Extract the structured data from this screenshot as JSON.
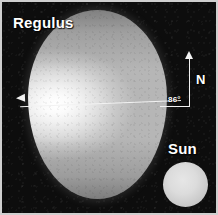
{
  "figure": {
    "title": "Regulus",
    "background_color": "#0d0d0d",
    "border_color": "#cfcfcf"
  },
  "star": {
    "name_label": "Regulus",
    "shape": "oblate-spheroid",
    "surface_color_bright": "#ffffff",
    "surface_color_dim": "#a8a8a8"
  },
  "comparison": {
    "name_label": "Sun",
    "disk_color": "#dcdcdc"
  },
  "annotations": {
    "north_label": "N",
    "inclination_angle": "86°",
    "axis_name": "rotation-axis",
    "arrow_color": "#f2f2f2"
  }
}
